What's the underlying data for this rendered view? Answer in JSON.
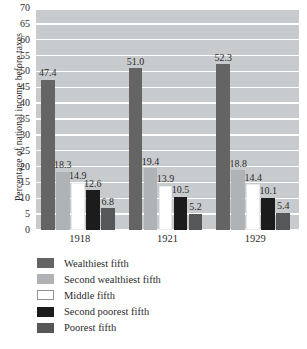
{
  "chart_data": {
    "type": "bar",
    "title": "",
    "subtitle": "",
    "xlabel": "",
    "ylabel": "Percentage of national income before taxes",
    "categories": [
      "1918",
      "1921",
      "1929"
    ],
    "series": [
      {
        "name": "Wealthiest fifth",
        "color": "#646464",
        "values": [
          47.4,
          51.0,
          52.3
        ]
      },
      {
        "name": "Second wealthiest fifth",
        "color": "#b0b3b5",
        "values": [
          18.3,
          19.4,
          18.8
        ]
      },
      {
        "name": "Middle fifth",
        "color": "#ffffff",
        "values": [
          14.9,
          13.9,
          14.4
        ]
      },
      {
        "name": "Second poorest fifth",
        "color": "#1c1c1c",
        "values": [
          12.6,
          10.5,
          10.1
        ]
      },
      {
        "name": "Poorest fifth",
        "color": "#555759",
        "values": [
          6.8,
          5.2,
          5.4
        ]
      }
    ],
    "ylim": [
      0,
      70
    ],
    "ytick_step": 5,
    "yticks": [
      "70",
      "65",
      "60",
      "55",
      "50",
      "45",
      "40",
      "35",
      "30",
      "25",
      "20",
      "15",
      "10",
      "5",
      "0"
    ],
    "grid": true,
    "grid_orientation": "horizontal",
    "legend_position": "bottom-left",
    "plot_background": "#c8cbcd",
    "gridline_color": "#ffffff",
    "data_labels": true
  },
  "legend": {
    "items": [
      {
        "label": "Wealthiest fifth",
        "color": "#646464"
      },
      {
        "label": "Second wealthiest fifth",
        "color": "#b0b3b5"
      },
      {
        "label": "Middle fifth",
        "color": "#ffffff"
      },
      {
        "label": "Second poorest fifth",
        "color": "#1c1c1c"
      },
      {
        "label": "Poorest fifth",
        "color": "#555759"
      }
    ]
  }
}
